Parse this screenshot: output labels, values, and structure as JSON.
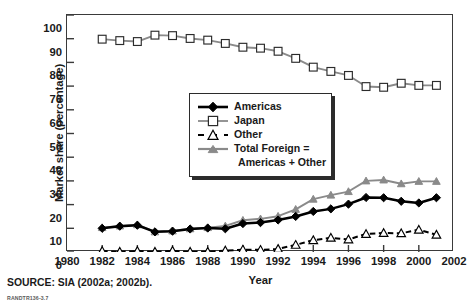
{
  "figure": {
    "source_note": "SOURCE: SIA (2002a; 2002b).",
    "figure_id": "RANDTR136-3.7"
  },
  "colors": {
    "americas": "#000000",
    "japan": "#8a8a8a",
    "other": "#000000",
    "total_foreign": "#8a8a8a",
    "axis": "#3a3a3a",
    "text": "#1a1a1a"
  },
  "legend": {
    "items": [
      {
        "label": "Americas",
        "marker": "filled-diamond-marker",
        "color": "#000000",
        "dash": false
      },
      {
        "label": "Japan",
        "marker": "open-square-marker",
        "color": "#8a8a8a",
        "dash": false
      },
      {
        "label": "Other",
        "marker": "open-triangle-marker",
        "color": "#000000",
        "dash": true
      },
      {
        "label": "Total Foreign =",
        "label_line2": "Americas + Other",
        "marker": "filled-triangle-marker",
        "color": "#8a8a8a",
        "dash": false
      }
    ]
  },
  "chart_data": {
    "type": "line",
    "title": "",
    "xlabel": "Year",
    "ylabel": "Market share (percentage)",
    "xlim": [
      1980,
      2002
    ],
    "ylim": [
      0,
      100
    ],
    "xticks": [
      1980,
      1982,
      1984,
      1986,
      1988,
      1990,
      1992,
      1994,
      1996,
      1998,
      2000,
      2002
    ],
    "yticks": [
      0,
      10,
      20,
      30,
      40,
      50,
      60,
      70,
      80,
      90,
      100
    ],
    "xtick_labels": [
      "1980",
      "1982",
      "1984",
      "1986",
      "1988",
      "1990",
      "1992",
      "1994",
      "1996",
      "1998",
      "2000",
      "2002"
    ],
    "ytick_labels": [
      "0",
      "10",
      "20",
      "30",
      "40",
      "50",
      "60",
      "70",
      "80",
      "90",
      "100"
    ],
    "grid": false,
    "legend_position": "center",
    "x": [
      1982,
      1983,
      1984,
      1985,
      1986,
      1987,
      1988,
      1989,
      1990,
      1991,
      1992,
      1993,
      1994,
      1995,
      1996,
      1997,
      1998,
      1999,
      2000,
      2001
    ],
    "series": [
      {
        "name": "Japan",
        "color": "#8a8a8a",
        "marker": "open-square-marker",
        "dash": false,
        "values": [
          89.8,
          89.2,
          88.8,
          91.5,
          91.3,
          90.1,
          89.4,
          88.0,
          86.4,
          86.0,
          84.7,
          81.7,
          78.0,
          76.2,
          74.5,
          69.8,
          69.5,
          71.2,
          70.3,
          70.3
        ]
      },
      {
        "name": "Americas",
        "color": "#000000",
        "marker": "filled-diamond-marker",
        "dash": false,
        "values": [
          10.0,
          10.9,
          11.3,
          8.5,
          8.8,
          9.7,
          10.1,
          9.8,
          12.0,
          12.4,
          13.5,
          15.0,
          17.1,
          18.2,
          20.2,
          23.0,
          22.9,
          21.4,
          20.7,
          22.9
        ]
      },
      {
        "name": "Other",
        "color": "#000000",
        "marker": "open-triangle-marker",
        "dash": true,
        "values": [
          0.4,
          0.1,
          0.4,
          0.1,
          0.5,
          0.1,
          0.1,
          0.6,
          1.0,
          0.9,
          1.3,
          3.0,
          5.0,
          6.0,
          5.3,
          7.6,
          8.0,
          7.9,
          9.4,
          7.3
        ]
      },
      {
        "name": "Total Foreign = Americas + Other",
        "color": "#8a8a8a",
        "marker": "filled-triangle-marker",
        "dash": false,
        "values": [
          10.3,
          11.0,
          11.5,
          8.5,
          8.9,
          9.8,
          10.3,
          11.0,
          13.4,
          14.0,
          15.1,
          18.0,
          22.3,
          24.0,
          25.5,
          30.0,
          30.4,
          28.8,
          29.8,
          29.8
        ]
      }
    ]
  }
}
